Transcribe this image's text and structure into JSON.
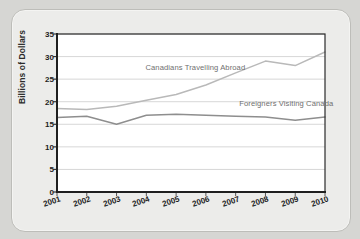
{
  "chart_data": {
    "type": "line",
    "title": "",
    "xlabel": "",
    "ylabel": "Billions of Dollars",
    "categories": [
      "2001",
      "2002",
      "2003",
      "2004",
      "2005",
      "2006",
      "2007",
      "2008",
      "2009",
      "2010"
    ],
    "x": [
      2001,
      2002,
      2003,
      2004,
      2005,
      2006,
      2007,
      2008,
      2009,
      2010
    ],
    "ylim": [
      0,
      35
    ],
    "ytick_values": [
      0,
      5,
      10,
      15,
      20,
      25,
      30,
      35
    ],
    "ytick_labels": [
      "0",
      "5",
      "10",
      "15",
      "20",
      "25",
      "30",
      "35"
    ],
    "grid": "horizontal",
    "legend_position": "inline-annotations",
    "series": [
      {
        "name": "Canadians Travelling Abroad",
        "color": "#b9b9b9",
        "values": [
          18.5,
          18.3,
          19.0,
          20.3,
          21.6,
          23.7,
          26.4,
          29.0,
          28.0,
          31.0
        ]
      },
      {
        "name": "Foreigners Visiting Canada",
        "color": "#8e8e8e",
        "values": [
          16.5,
          16.8,
          15.0,
          17.0,
          17.2,
          17.0,
          16.8,
          16.6,
          15.9,
          16.6
        ]
      }
    ],
    "annotations": [
      {
        "text": "Canadians Travelling Abroad",
        "x_frac": 0.33,
        "y_value": 27.4
      },
      {
        "text": "Foreigners Visiting Canada",
        "x_frac": 0.68,
        "y_value": 19.6
      }
    ]
  },
  "axes": {
    "ylabel": "Billions of Dollars"
  }
}
